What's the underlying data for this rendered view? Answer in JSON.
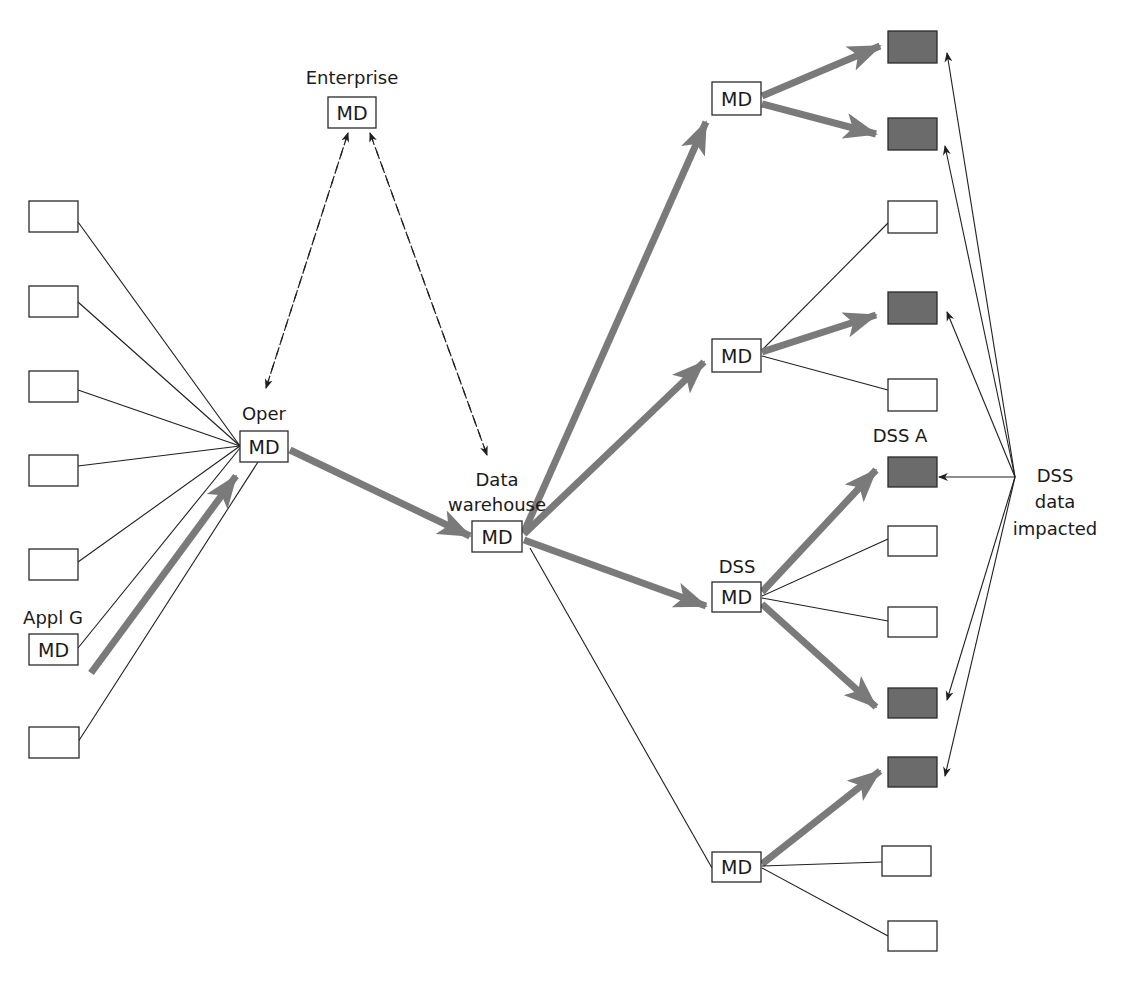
{
  "diagram": {
    "colors": {
      "impacted_fill": "#6b6b6b",
      "thick_arrow": "#7a7a7a",
      "line": "#1f1f1f",
      "box_border": "#2a2a2a"
    },
    "md_text": "MD",
    "labels": {
      "enterprise": "Enterprise",
      "oper": "Oper",
      "appl_g": "Appl G",
      "data_warehouse_1": "Data",
      "data_warehouse_2": "warehouse",
      "dss": "DSS",
      "dss_a": "DSS A",
      "dss_impacted_1": "DSS",
      "dss_impacted_2": "data",
      "dss_impacted_3": "impacted"
    },
    "md_nodes": [
      {
        "id": "enterprise",
        "x": 328,
        "y": 97,
        "w": 48,
        "h": 31
      },
      {
        "id": "oper",
        "x": 240,
        "y": 431,
        "w": 48,
        "h": 31
      },
      {
        "id": "appl_g",
        "x": 29,
        "y": 634,
        "w": 49,
        "h": 31
      },
      {
        "id": "warehouse",
        "x": 472,
        "y": 521,
        "w": 50,
        "h": 31
      },
      {
        "id": "md_top",
        "x": 712,
        "y": 82,
        "w": 49,
        "h": 33
      },
      {
        "id": "md_mid",
        "x": 712,
        "y": 339,
        "w": 49,
        "h": 33
      },
      {
        "id": "dss",
        "x": 712,
        "y": 582,
        "w": 49,
        "h": 30
      },
      {
        "id": "md_bottom",
        "x": 712,
        "y": 852,
        "w": 49,
        "h": 30
      }
    ],
    "source_boxes": [
      {
        "x": 29,
        "y": 201,
        "w": 49,
        "h": 31
      },
      {
        "x": 29,
        "y": 286,
        "w": 49,
        "h": 31
      },
      {
        "x": 29,
        "y": 371,
        "w": 49,
        "h": 31
      },
      {
        "x": 29,
        "y": 455,
        "w": 49,
        "h": 31
      },
      {
        "x": 29,
        "y": 549,
        "w": 49,
        "h": 31
      },
      {
        "x": 29,
        "y": 727,
        "w": 50,
        "h": 31
      }
    ],
    "target_boxes": [
      {
        "x": 888,
        "y": 31,
        "w": 49,
        "h": 32,
        "impacted": true
      },
      {
        "x": 888,
        "y": 118,
        "w": 49,
        "h": 32,
        "impacted": true
      },
      {
        "x": 888,
        "y": 201,
        "w": 49,
        "h": 32,
        "impacted": false
      },
      {
        "x": 888,
        "y": 292,
        "w": 49,
        "h": 32,
        "impacted": true
      },
      {
        "x": 888,
        "y": 379,
        "w": 49,
        "h": 32,
        "impacted": false
      },
      {
        "x": 888,
        "y": 457,
        "w": 49,
        "h": 30,
        "impacted": true
      },
      {
        "x": 888,
        "y": 526,
        "w": 49,
        "h": 30,
        "impacted": false
      },
      {
        "x": 888,
        "y": 607,
        "w": 49,
        "h": 30,
        "impacted": false
      },
      {
        "x": 888,
        "y": 688,
        "w": 49,
        "h": 30,
        "impacted": true
      },
      {
        "x": 888,
        "y": 757,
        "w": 49,
        "h": 30,
        "impacted": true
      },
      {
        "x": 882,
        "y": 846,
        "w": 49,
        "h": 30,
        "impacted": false
      },
      {
        "x": 888,
        "y": 921,
        "w": 49,
        "h": 30,
        "impacted": false
      }
    ],
    "caption_positions": {
      "enterprise": {
        "x": 352,
        "y": 84
      },
      "oper": {
        "x": 264,
        "y": 420
      },
      "appl_g": {
        "x": 53,
        "y": 624
      },
      "data_warehouse_1": {
        "x": 497,
        "y": 486
      },
      "data_warehouse_2": {
        "x": 497,
        "y": 511
      },
      "dss": {
        "x": 737,
        "y": 573
      },
      "dss_a": {
        "x": 900,
        "y": 442
      },
      "dss_impacted_1": {
        "x": 1055,
        "y": 482
      },
      "dss_impacted_2": {
        "x": 1055,
        "y": 508
      },
      "dss_impacted_3": {
        "x": 1055,
        "y": 535
      }
    }
  }
}
